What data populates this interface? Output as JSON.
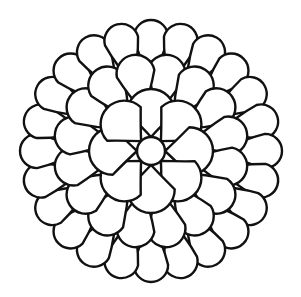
{
  "image": {
    "subject": "flower mandala coloring page",
    "background_color": "#ffffff",
    "line_color": "#111111",
    "line_width": 2.4
  },
  "mandala": {
    "center": {
      "x": 151,
      "y": 151
    },
    "center_circle_radius": 14,
    "rings": [
      {
        "name": "inner",
        "petal_count": 8,
        "inner_radius": 14,
        "outer_radius": 62,
        "half_width_deg": 22.5,
        "rotation_deg": 0
      },
      {
        "name": "middle",
        "petal_count": 16,
        "inner_radius": 40,
        "outer_radius": 98,
        "half_width_deg": 11.25,
        "rotation_deg": 11.25
      },
      {
        "name": "outer",
        "petal_count": 24,
        "inner_radius": 70,
        "outer_radius": 131,
        "half_width_deg": 7.5,
        "rotation_deg": 0
      }
    ]
  }
}
